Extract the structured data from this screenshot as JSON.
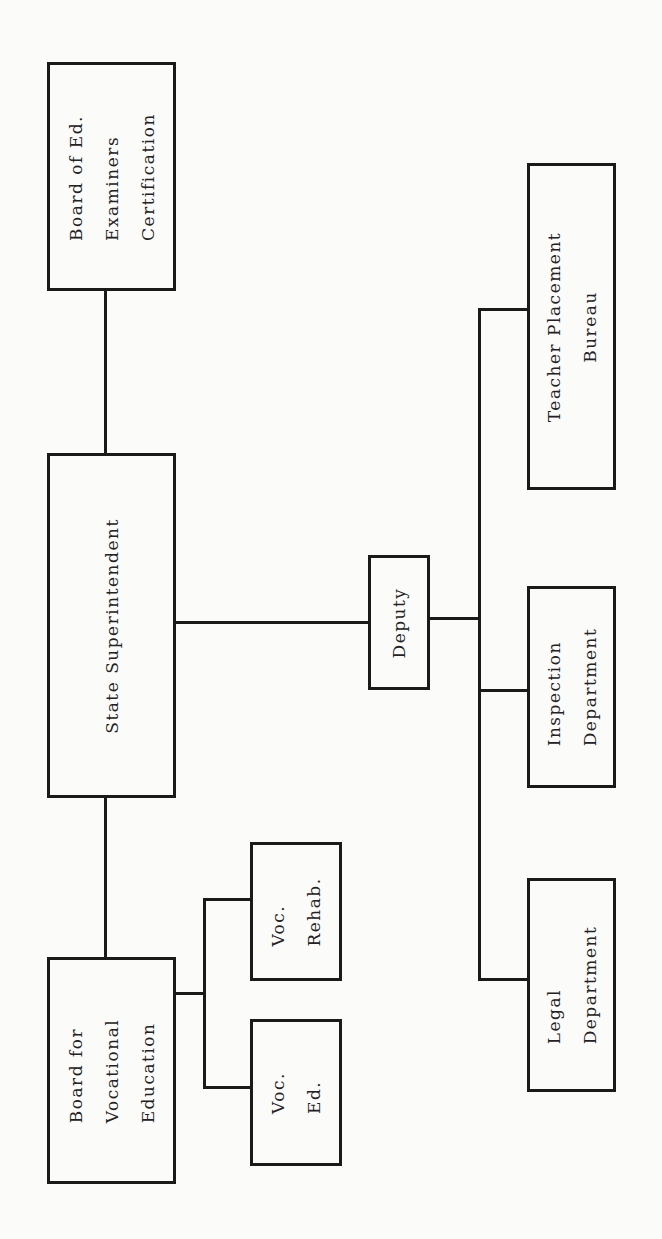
{
  "diagram": {
    "type": "org_chart",
    "orientation": "rotated-90-ccw",
    "nodes": {
      "board_examiners": {
        "label": "Board of Ed.\nExaminers\nCertification"
      },
      "state_superintendent": {
        "label": "State Superintendent"
      },
      "board_vocational": {
        "label": "Board for\nVocational\nEducation"
      },
      "voc_rehab": {
        "label": "Voc.\nRehab."
      },
      "voc_ed": {
        "label": "Voc.\nEd."
      },
      "deputy": {
        "label": "Deputy"
      },
      "teacher_placement": {
        "label": "Teacher Placement\nBureau"
      },
      "inspection": {
        "label": "Inspection\nDepartment"
      },
      "legal": {
        "label": "Legal\nDepartment"
      }
    },
    "edges": [
      [
        "state_superintendent",
        "board_examiners"
      ],
      [
        "state_superintendent",
        "board_vocational"
      ],
      [
        "state_superintendent",
        "deputy"
      ],
      [
        "board_vocational",
        "voc_rehab"
      ],
      [
        "board_vocational",
        "voc_ed"
      ],
      [
        "deputy",
        "teacher_placement"
      ],
      [
        "deputy",
        "inspection"
      ],
      [
        "deputy",
        "legal"
      ]
    ]
  }
}
